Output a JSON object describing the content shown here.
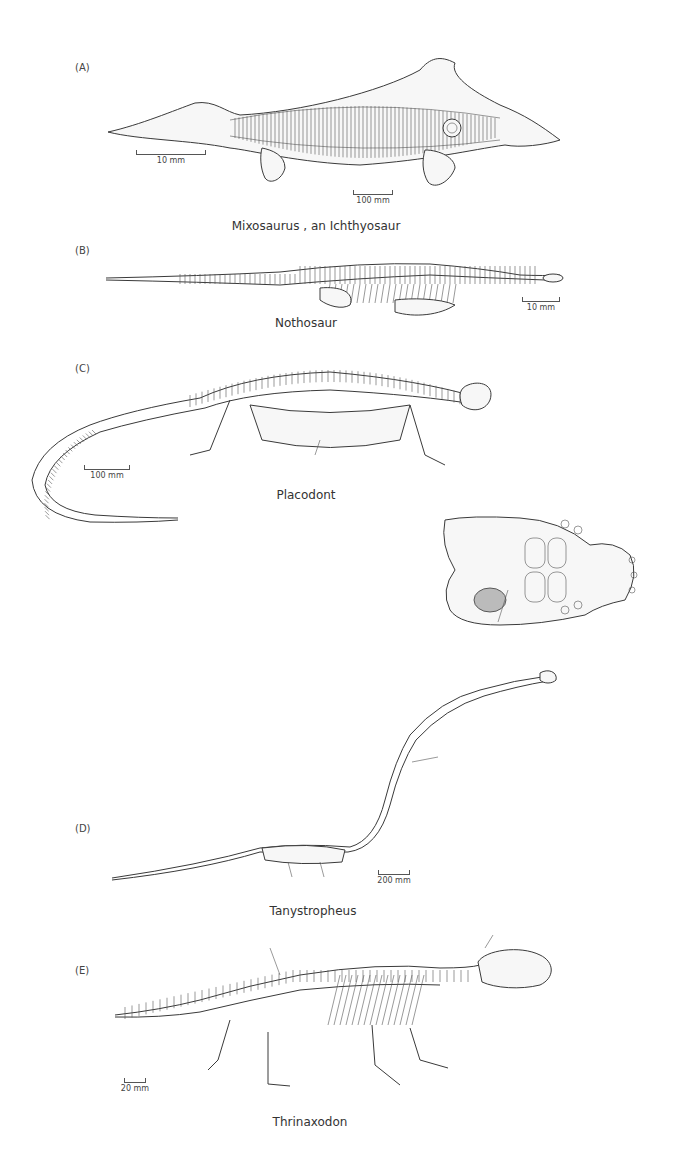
{
  "figure": {
    "panels": [
      {
        "id": "A",
        "label": "(A)",
        "caption": "Mixosaurus , an Ichthyosaur",
        "scale_bars": [
          "10 mm",
          "100 mm"
        ]
      },
      {
        "id": "B",
        "label": "(B)",
        "caption": "Nothosaur",
        "scale_bars": [
          "10 mm"
        ]
      },
      {
        "id": "C",
        "label": "(C)",
        "caption": "Placodont",
        "scale_bars": [
          "100 mm"
        ]
      },
      {
        "id": "D",
        "label": "(D)",
        "caption": "Tanystropheus",
        "scale_bars": [
          "200 mm"
        ]
      },
      {
        "id": "E",
        "label": "(E)",
        "caption": "Thrinaxodon",
        "scale_bars": [
          "20 mm"
        ]
      }
    ],
    "colors": {
      "line": "#3a3a3a",
      "background": "#ffffff",
      "text": "#333333"
    }
  }
}
